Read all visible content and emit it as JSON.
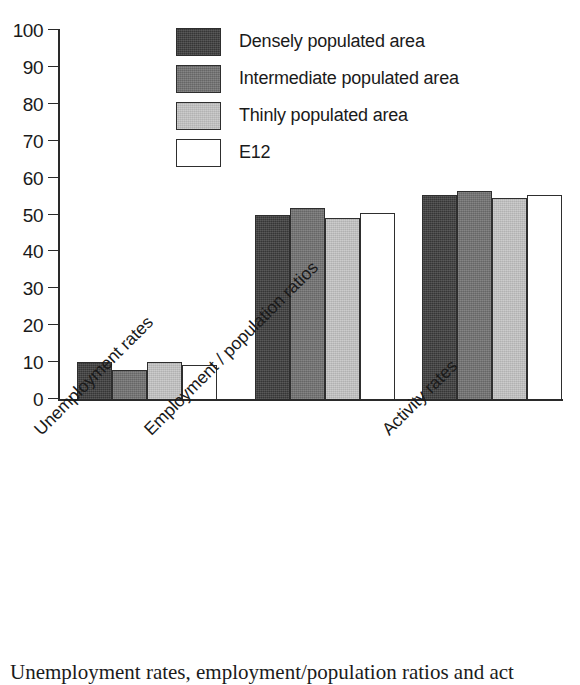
{
  "chart_data": {
    "type": "bar",
    "title": "",
    "subtitle": "",
    "xlabel": "",
    "ylabel": "",
    "ylim": [
      0,
      100
    ],
    "yticks": [
      0,
      10,
      20,
      30,
      40,
      50,
      60,
      70,
      80,
      90,
      100
    ],
    "grid": false,
    "legend_position": "top-center",
    "categories": [
      "Unemployment rates",
      "Employment / population ratios",
      "Activity rates"
    ],
    "series": [
      {
        "name": "Densely populated area",
        "color": "#3b3b3b",
        "values": [
          10.0,
          50.0,
          55.3
        ]
      },
      {
        "name": "Intermediate populated area",
        "color": "#6f6f6f",
        "values": [
          7.8,
          51.9,
          56.5
        ]
      },
      {
        "name": "Thinly populated area",
        "color": "#c3c3c3",
        "values": [
          9.9,
          49.0,
          54.6
        ]
      },
      {
        "name": "E12",
        "color": "#ffffff",
        "values": [
          9.1,
          50.3,
          55.3
        ]
      }
    ]
  },
  "legend": {
    "items": [
      {
        "label": "Densely populated area"
      },
      {
        "label": "Intermediate populated area"
      },
      {
        "label": "Thinly populated area"
      },
      {
        "label": "E12"
      }
    ]
  },
  "caption": {
    "text": "Unemployment rates, employment/population ratios and act"
  }
}
